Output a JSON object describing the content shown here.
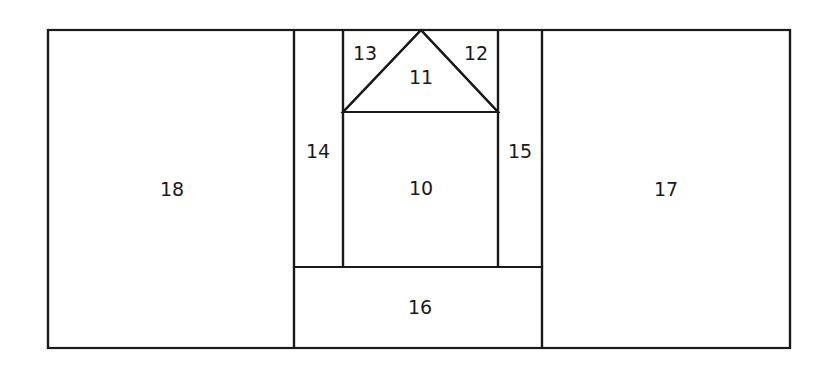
{
  "figure": {
    "background_color": "#ffffff",
    "line_color": "#1a1a1a",
    "label_color": "#1a1a1a",
    "outer_rect": {
      "x": 48,
      "y": 30,
      "width": 742,
      "height": 318
    }
  },
  "regions": [
    {
      "id": "region-10",
      "label": "10",
      "shape": "rectangle",
      "label_x": 421,
      "label_y": 189,
      "outline": "M343,112 L498,112 L498,267 L343,267 Z"
    },
    {
      "id": "region-11",
      "label": "11",
      "shape": "triangle",
      "label_x": 421,
      "label_y": 78,
      "outline": "M343,112 L421,30 L498,112 Z"
    },
    {
      "id": "region-12",
      "label": "12",
      "shape": "triangle",
      "label_x": 476,
      "label_y": 54,
      "outline": "M421,30 L498,30 L498,112 Z"
    },
    {
      "id": "region-13",
      "label": "13",
      "shape": "triangle",
      "label_x": 365,
      "label_y": 54,
      "outline": "M343,30 L421,30 L343,112 Z"
    },
    {
      "id": "region-14",
      "label": "14",
      "shape": "rectangle",
      "label_x": 318,
      "label_y": 152,
      "outline": "M294,30 L343,30 L343,267 L294,267 Z"
    },
    {
      "id": "region-15",
      "label": "15",
      "shape": "rectangle",
      "label_x": 520,
      "label_y": 152,
      "outline": "M498,30 L542,30 L542,267 L498,267 Z"
    },
    {
      "id": "region-16",
      "label": "16",
      "shape": "rectangle",
      "label_x": 420,
      "label_y": 308,
      "outline": "M294,267 L542,267 L542,348 L294,348 Z"
    },
    {
      "id": "region-17",
      "label": "17",
      "shape": "rectangle",
      "label_x": 666,
      "label_y": 190,
      "outline": "M542,30 L790,30 L790,348 L542,348 Z"
    },
    {
      "id": "region-18",
      "label": "18",
      "shape": "rectangle",
      "label_x": 172,
      "label_y": 190,
      "outline": "M48,30 L294,30 L294,348 L48,348 Z"
    }
  ]
}
